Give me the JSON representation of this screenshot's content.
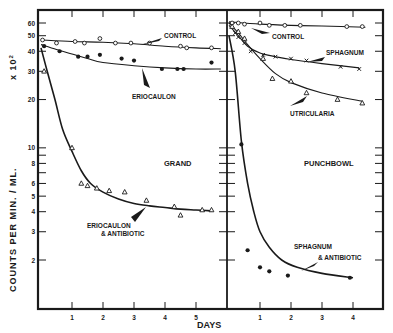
{
  "chart_data": {
    "type": "line",
    "title": "",
    "xlabel": "DAYS",
    "ylabel": "COUNTS PER MIN. / ML. x 10²",
    "yscale": "log",
    "ylim": [
      1.3,
      68
    ],
    "yticks": [
      60,
      50,
      40,
      30,
      20,
      10,
      8,
      6,
      5,
      4,
      3,
      2
    ],
    "grid": false,
    "panels": [
      {
        "name": "GRAND",
        "xticks": [
          1,
          2,
          3,
          4,
          5
        ],
        "xlim": [
          -0.1,
          5.9
        ],
        "series": [
          {
            "name": "CONTROL",
            "marker": "circle-open",
            "points": [
              [
                0.05,
                47
              ],
              [
                0.5,
                45
              ],
              [
                1.1,
                46
              ],
              [
                1.4,
                45
              ],
              [
                1.9,
                48
              ],
              [
                2.4,
                45
              ],
              [
                2.9,
                45
              ],
              [
                3.5,
                45
              ],
              [
                4.5,
                43
              ],
              [
                4.7,
                42
              ],
              [
                5.5,
                42
              ]
            ],
            "curve": [
              [
                0,
                47
              ],
              [
                1,
                46
              ],
              [
                2,
                45.5
              ],
              [
                3,
                44.5
              ],
              [
                4,
                43
              ],
              [
                5,
                42
              ],
              [
                5.8,
                41.5
              ]
            ]
          },
          {
            "name": "ERIOCAULON",
            "marker": "circle-filled",
            "points": [
              [
                0.1,
                43
              ],
              [
                0.6,
                40
              ],
              [
                1.2,
                37
              ],
              [
                1.5,
                37
              ],
              [
                1.9,
                38
              ],
              [
                2.6,
                36
              ],
              [
                3.0,
                35
              ],
              [
                3.9,
                31
              ],
              [
                4.4,
                31
              ],
              [
                4.6,
                31
              ],
              [
                5.5,
                34
              ]
            ],
            "curve": [
              [
                0,
                44
              ],
              [
                0.5,
                41
              ],
              [
                1,
                38.5
              ],
              [
                1.5,
                36
              ],
              [
                2,
                34
              ],
              [
                3,
                32.5
              ],
              [
                4,
                31.5
              ],
              [
                5,
                31
              ],
              [
                5.8,
                31
              ]
            ]
          },
          {
            "name": "ERIOCAULON & ANTIBIOTIC",
            "marker": "triangle-open",
            "points": [
              [
                0.1,
                30
              ],
              [
                1.0,
                10
              ],
              [
                1.3,
                6
              ],
              [
                1.5,
                5.8
              ],
              [
                1.8,
                5.6
              ],
              [
                2.2,
                5.4
              ],
              [
                2.7,
                5.3
              ],
              [
                3.4,
                4.7
              ],
              [
                4.3,
                4.3
              ],
              [
                4.5,
                3.8
              ],
              [
                5.2,
                4.1
              ],
              [
                5.5,
                4.1
              ]
            ],
            "curve": [
              [
                0,
                42
              ],
              [
                0.2,
                30
              ],
              [
                0.45,
                20
              ],
              [
                0.7,
                13
              ],
              [
                1.0,
                9.5
              ],
              [
                1.3,
                7.2
              ],
              [
                1.6,
                6
              ],
              [
                2,
                5.3
              ],
              [
                2.5,
                4.8
              ],
              [
                3,
                4.5
              ],
              [
                3.5,
                4.35
              ],
              [
                4,
                4.25
              ],
              [
                4.5,
                4.15
              ],
              [
                5,
                4.1
              ],
              [
                5.5,
                4.05
              ]
            ]
          }
        ],
        "annotations": [
          "CONTROL",
          "ERIOCAULON",
          "GRAND",
          "ERIOCAULON",
          "& ANTIBIOTIC"
        ]
      },
      {
        "name": "PUNCHBOWL",
        "xticks": [
          1,
          2,
          3,
          4
        ],
        "xlim": [
          -0.1,
          5.0
        ],
        "series": [
          {
            "name": "CONTROL",
            "marker": "circle-open",
            "points": [
              [
                0.1,
                60
              ],
              [
                0.3,
                60
              ],
              [
                0.5,
                59
              ],
              [
                1.0,
                60
              ],
              [
                1.3,
                58
              ],
              [
                1.8,
                58
              ],
              [
                2.3,
                58
              ],
              [
                3.8,
                57
              ],
              [
                4.3,
                57
              ]
            ],
            "curve": [
              [
                0,
                61
              ],
              [
                1,
                59
              ],
              [
                2,
                58
              ],
              [
                3,
                57.5
              ],
              [
                4.4,
                56.5
              ]
            ]
          },
          {
            "name": "SPHAGNUM",
            "marker": "x",
            "points": [
              [
                0.2,
                52
              ],
              [
                0.3,
                49
              ],
              [
                0.5,
                45
              ],
              [
                0.7,
                40
              ],
              [
                1.1,
                38
              ],
              [
                1.5,
                37
              ],
              [
                2.0,
                36
              ],
              [
                2.5,
                35
              ],
              [
                3.6,
                32
              ],
              [
                4.2,
                31
              ]
            ],
            "curve": [
              [
                0,
                58
              ],
              [
                0.3,
                50
              ],
              [
                0.6,
                43
              ],
              [
                1,
                39
              ],
              [
                1.5,
                37
              ],
              [
                2,
                35.5
              ],
              [
                3,
                33.5
              ],
              [
                4.2,
                31.5
              ]
            ]
          },
          {
            "name": "UTRICULARIA",
            "marker": "triangle-open",
            "points": [
              [
                0.1,
                57
              ],
              [
                0.3,
                53
              ],
              [
                0.5,
                48
              ],
              [
                1.1,
                36
              ],
              [
                1.4,
                27
              ],
              [
                2.0,
                26
              ],
              [
                2.5,
                22
              ],
              [
                3.5,
                20
              ],
              [
                4.3,
                19
              ]
            ],
            "curve": [
              [
                0,
                60
              ],
              [
                0.3,
                52
              ],
              [
                0.6,
                44
              ],
              [
                1,
                36
              ],
              [
                1.5,
                29
              ],
              [
                2,
                25.5
              ],
              [
                3,
                22
              ],
              [
                4.3,
                19.5
              ]
            ]
          },
          {
            "name": "SPHAGNUM & ANTIBIOTIC",
            "marker": "circle-filled",
            "points": [
              [
                0.4,
                10.5
              ],
              [
                0.6,
                2.3
              ],
              [
                1.0,
                1.8
              ],
              [
                1.3,
                1.7
              ],
              [
                1.9,
                1.6
              ],
              [
                3.9,
                1.55
              ]
            ],
            "curve": [
              [
                0,
                50
              ],
              [
                0.2,
                30
              ],
              [
                0.4,
                11
              ],
              [
                0.6,
                6
              ],
              [
                0.8,
                4
              ],
              [
                1,
                3
              ],
              [
                1.3,
                2.4
              ],
              [
                1.7,
                2.0
              ],
              [
                2.2,
                1.8
              ],
              [
                3,
                1.65
              ],
              [
                4,
                1.55
              ]
            ]
          }
        ],
        "annotations": [
          "CONTROL",
          "SPHAGNUM",
          "UTRICULARIA",
          "PUNCHBOWL",
          "SPHAGNUM",
          "& ANTIBIOTIC"
        ]
      }
    ]
  },
  "labels": {
    "yaxis_left": "COUNTS   PER   MIN. / ML.",
    "yaxis_exp": "x 10",
    "yaxis_sup": "2",
    "xaxis": "DAYS",
    "grand": "GRAND",
    "punchbowl": "PUNCHBOWL",
    "g_control": "CONTROL",
    "g_erio": "ERIOCAULON",
    "g_erio_ab1": "ERIOCAULON",
    "g_erio_ab2": "& ANTIBIOTIC",
    "p_control": "CONTROL",
    "p_sphag": "SPHAGNUM",
    "p_utric": "UTRICULARIA",
    "p_sphag_ab1": "SPHAGNUM",
    "p_sphag_ab2": "& ANTIBIOTIC"
  },
  "colors": {
    "ink": "#1a1a1a",
    "paper": "#ffffff"
  }
}
